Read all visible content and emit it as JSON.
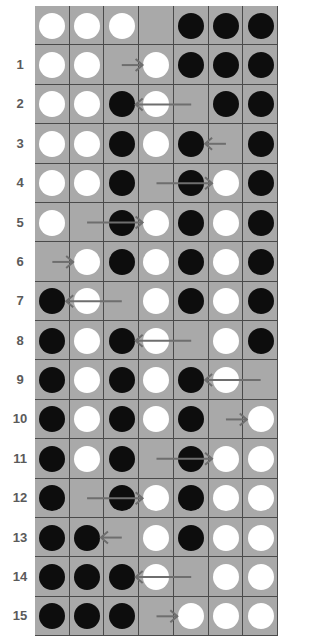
{
  "puzzle": {
    "colors": {
      "white_piece": "#ffffff",
      "black_piece": "#0d0d0d",
      "cell": "#a9a9a9",
      "grid_line": "#4a4a4a",
      "arrow": "#6e6e6e",
      "label": "#5a5a5a"
    },
    "rows": [
      {
        "label": "",
        "cells": [
          "W",
          "W",
          "W",
          "E",
          "B",
          "B",
          "B"
        ],
        "arrow": null
      },
      {
        "label": "1",
        "cells": [
          "W",
          "W",
          "E",
          "W",
          "B",
          "B",
          "B"
        ],
        "arrow": {
          "from": 2.5,
          "to": 3.1
        }
      },
      {
        "label": "2",
        "cells": [
          "W",
          "W",
          "B",
          "W",
          "E",
          "B",
          "B"
        ],
        "arrow": {
          "from": 4.5,
          "to": 2.9
        }
      },
      {
        "label": "3",
        "cells": [
          "W",
          "W",
          "B",
          "W",
          "B",
          "E",
          "B"
        ],
        "arrow": {
          "from": 5.5,
          "to": 4.9
        }
      },
      {
        "label": "4",
        "cells": [
          "W",
          "W",
          "B",
          "E",
          "B",
          "W",
          "B"
        ],
        "arrow": {
          "from": 3.5,
          "to": 5.1
        }
      },
      {
        "label": "5",
        "cells": [
          "W",
          "E",
          "B",
          "W",
          "B",
          "W",
          "B"
        ],
        "arrow": {
          "from": 1.5,
          "to": 3.1
        }
      },
      {
        "label": "6",
        "cells": [
          "E",
          "W",
          "B",
          "W",
          "B",
          "W",
          "B"
        ],
        "arrow": {
          "from": 0.5,
          "to": 1.1
        }
      },
      {
        "label": "7",
        "cells": [
          "B",
          "W",
          "E",
          "W",
          "B",
          "W",
          "B"
        ],
        "arrow": {
          "from": 2.5,
          "to": 0.9
        }
      },
      {
        "label": "8",
        "cells": [
          "B",
          "W",
          "B",
          "W",
          "E",
          "W",
          "B"
        ],
        "arrow": {
          "from": 4.5,
          "to": 2.9
        }
      },
      {
        "label": "9",
        "cells": [
          "B",
          "W",
          "B",
          "W",
          "B",
          "W",
          "E"
        ],
        "arrow": {
          "from": 6.5,
          "to": 4.9
        }
      },
      {
        "label": "10",
        "cells": [
          "B",
          "W",
          "B",
          "W",
          "B",
          "E",
          "W"
        ],
        "arrow": {
          "from": 5.5,
          "to": 6.1
        }
      },
      {
        "label": "11",
        "cells": [
          "B",
          "W",
          "B",
          "E",
          "B",
          "W",
          "W"
        ],
        "arrow": {
          "from": 3.5,
          "to": 5.1
        }
      },
      {
        "label": "12",
        "cells": [
          "B",
          "E",
          "B",
          "W",
          "B",
          "W",
          "W"
        ],
        "arrow": {
          "from": 1.5,
          "to": 3.1
        }
      },
      {
        "label": "13",
        "cells": [
          "B",
          "B",
          "E",
          "W",
          "B",
          "W",
          "W"
        ],
        "arrow": {
          "from": 2.5,
          "to": 1.9
        }
      },
      {
        "label": "14",
        "cells": [
          "B",
          "B",
          "B",
          "W",
          "E",
          "W",
          "W"
        ],
        "arrow": {
          "from": 4.5,
          "to": 2.9
        }
      },
      {
        "label": "15",
        "cells": [
          "B",
          "B",
          "B",
          "E",
          "W",
          "W",
          "W"
        ],
        "arrow": {
          "from": 3.5,
          "to": 4.1
        }
      }
    ]
  }
}
